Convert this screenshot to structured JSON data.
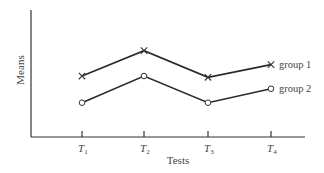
{
  "chart_data": {
    "type": "line",
    "title": "",
    "xlabel": "Tests",
    "ylabel": "Means",
    "categories": [
      "T1",
      "T2",
      "T3",
      "T4"
    ],
    "tick_labels": [
      {
        "base": "T",
        "sub": "1"
      },
      {
        "base": "T",
        "sub": "2"
      },
      {
        "base": "T",
        "sub": "3"
      },
      {
        "base": "T",
        "sub": "4"
      }
    ],
    "series": [
      {
        "name": "group 1",
        "marker": "x",
        "values": [
          2.4,
          3.4,
          2.35,
          2.85
        ]
      },
      {
        "name": "group 2",
        "marker": "o",
        "values": [
          1.35,
          2.4,
          1.35,
          1.9
        ]
      }
    ],
    "ylim": [
      0,
      5
    ],
    "y_ticks": "none",
    "grid": false,
    "legend_position": "inline-right-end-of-lines"
  }
}
